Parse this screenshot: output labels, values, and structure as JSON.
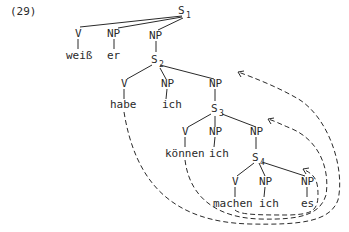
{
  "example_number": "(29)",
  "nodes": {
    "s1": {
      "label": "S",
      "sub": "1"
    },
    "v1": {
      "label": "V",
      "word": "weiß"
    },
    "np1": {
      "label": "NP",
      "word": "er"
    },
    "np1b": {
      "label": "NP"
    },
    "s2": {
      "label": "S",
      "sub": "2"
    },
    "v2": {
      "label": "V",
      "word": "habe"
    },
    "np2": {
      "label": "NP",
      "word": "ich"
    },
    "np2b": {
      "label": "NP"
    },
    "s3": {
      "label": "S",
      "sub": "3"
    },
    "v3": {
      "label": "V",
      "word": "können"
    },
    "np3": {
      "label": "NP",
      "word": "ich"
    },
    "np3b": {
      "label": "NP"
    },
    "s4": {
      "label": "S",
      "sub": "4"
    },
    "v4": {
      "label": "V",
      "word": "machen"
    },
    "np4": {
      "label": "NP",
      "word": "ich"
    },
    "np4b": {
      "label": "NP",
      "word": "es"
    }
  },
  "movement_arrows": [
    {
      "from": "habe",
      "to": "S2-NP"
    },
    {
      "from": "können",
      "to": "S3-NP"
    },
    {
      "from": "machen",
      "to": "S4-NP-es"
    }
  ]
}
